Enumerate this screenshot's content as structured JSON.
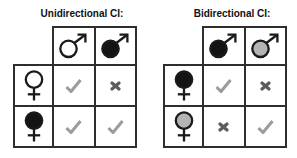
{
  "colors": {
    "outline": "#1a1a1a",
    "grid_border": "#2e2e2e",
    "fill_black": "#141414",
    "fill_gray": "#b4b4b4",
    "fill_white": "#ffffff",
    "check": "#9c9c9c",
    "cross": "#5c5c5c",
    "title_text": "#111111"
  },
  "tables": [
    {
      "title": "Unidirectional CI:",
      "columns": [
        {
          "symbol": "male",
          "fill": "white"
        },
        {
          "symbol": "male",
          "fill": "black"
        }
      ],
      "rows": [
        {
          "symbol": "female",
          "fill": "white",
          "cells": [
            "check",
            "cross"
          ]
        },
        {
          "symbol": "female",
          "fill": "black",
          "cells": [
            "check",
            "check"
          ]
        }
      ]
    },
    {
      "title": "Bidirectional CI:",
      "columns": [
        {
          "symbol": "male",
          "fill": "black"
        },
        {
          "symbol": "male",
          "fill": "gray"
        }
      ],
      "rows": [
        {
          "symbol": "female",
          "fill": "black",
          "cells": [
            "check",
            "cross"
          ]
        },
        {
          "symbol": "female",
          "fill": "gray",
          "cells": [
            "cross",
            "check"
          ]
        }
      ]
    }
  ]
}
